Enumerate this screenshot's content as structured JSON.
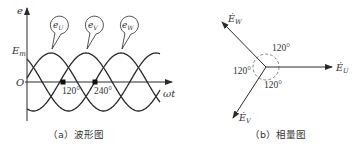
{
  "waveform": {
    "caption": "（a）波形图",
    "y_axis_label": "e",
    "x_axis_label": "ωt",
    "origin_label": "O",
    "peak_label": "E",
    "peak_sub": "m",
    "tick_120": "120°",
    "tick_240": "240°",
    "curves": [
      {
        "name": "e",
        "sub": "U",
        "phase_deg": 0
      },
      {
        "name": "e",
        "sub": "V",
        "phase_deg": 120
      },
      {
        "name": "e",
        "sub": "W",
        "phase_deg": 240
      }
    ]
  },
  "phasor": {
    "caption": "（b）相量图",
    "angle_top": "120°",
    "angle_left": "120°",
    "angle_bottom": "120°",
    "vectors": [
      {
        "name": "Ė",
        "sub": "U",
        "angle_deg": 0
      },
      {
        "name": "Ė",
        "sub": "V",
        "angle_deg": -120
      },
      {
        "name": "Ė",
        "sub": "W",
        "angle_deg": 120
      }
    ]
  },
  "colors": {
    "line": "#2a2a2a",
    "text": "#333333",
    "dash": "#666666"
  }
}
